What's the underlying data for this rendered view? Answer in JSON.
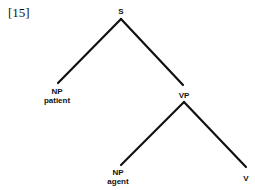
{
  "example_number": "[15]",
  "nodes": {
    "s": {
      "label": "S"
    },
    "np_patient": {
      "label": "NP",
      "sublabel": "patient"
    },
    "vp": {
      "label": "VP"
    },
    "np_agent": {
      "label": "NP",
      "sublabel": "agent"
    },
    "v": {
      "label": "V"
    }
  },
  "colors": {
    "line": "#111111",
    "background": "#ffffff"
  }
}
